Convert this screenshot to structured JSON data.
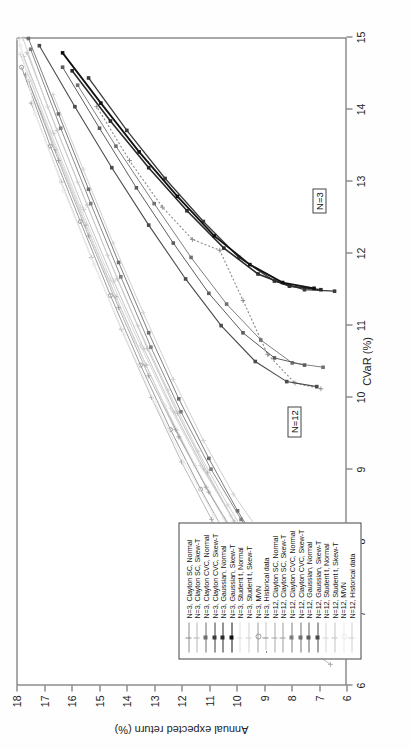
{
  "chart_data": {
    "type": "line",
    "title": "",
    "xlabel": "CVaR (%)",
    "ylabel": "Annual expected return (%)",
    "xlim": [
      6,
      15
    ],
    "ylim": [
      6,
      18
    ],
    "xticks": [
      6,
      7,
      8,
      9,
      10,
      11,
      12,
      13,
      14,
      15
    ],
    "yticks": [
      6,
      7,
      8,
      9,
      10,
      11,
      12,
      13,
      14,
      15,
      16,
      17,
      18
    ],
    "grid": false,
    "legend_position": "lower-left",
    "annotations": [
      {
        "text": "N=3",
        "x": 12.55,
        "y": 7.25
      },
      {
        "text": "N=12",
        "x": 9.45,
        "y": 8.15
      }
    ],
    "series": [
      {
        "name": "N=3, Clayton SC, Normal",
        "color": "#8c8c8c",
        "marker": "plus",
        "dash": "solid",
        "width": 0.8,
        "x": [
          6.62,
          6.95,
          7.45,
          8.05,
          8.75,
          9.55,
          10.45,
          11.4,
          12.4,
          13.45,
          14.5
        ],
        "y": [
          6.95,
          7.95,
          9.0,
          10.05,
          11.1,
          12.2,
          13.3,
          14.4,
          15.5,
          16.6,
          17.7
        ]
      },
      {
        "name": "N=3, Clayton SC, Skew-T",
        "color": "#b5b5b5",
        "marker": "plus",
        "dash": "solid",
        "width": 0.8,
        "x": [
          6.72,
          7.1,
          7.6,
          8.22,
          8.95,
          9.78,
          10.68,
          11.65,
          12.68,
          13.72,
          14.8
        ],
        "y": [
          6.9,
          7.9,
          8.95,
          10.0,
          11.05,
          12.15,
          13.25,
          14.35,
          15.45,
          16.55,
          17.65
        ]
      },
      {
        "name": "N=3, Clayton CVC, Normal",
        "color": "#6e6e6e",
        "marker": "square",
        "dash": "solid",
        "width": 0.9,
        "x": [
          6.88,
          7.25,
          7.78,
          8.42,
          9.15,
          9.98,
          10.9,
          11.88,
          12.9,
          13.95,
          15.0
        ],
        "y": [
          6.85,
          7.85,
          8.9,
          9.95,
          11.0,
          12.1,
          13.2,
          14.3,
          15.4,
          16.5,
          17.6
        ]
      },
      {
        "name": "N=3, Clayton CVC, Skew-T",
        "color": "#3a3a3a",
        "marker": "square",
        "dash": "solid",
        "width": 1.3,
        "x": [
          11.48,
          11.5,
          11.62,
          11.95,
          12.45,
          13.05,
          13.72,
          14.45
        ],
        "y": [
          6.4,
          7.5,
          8.6,
          9.9,
          11.2,
          12.6,
          14.0,
          15.4
        ]
      },
      {
        "name": "N=3, Gaussian, Normal",
        "color": "#2a2a2a",
        "marker": "square",
        "dash": "solid",
        "width": 1.6,
        "x": [
          11.5,
          11.55,
          11.72,
          12.08,
          12.6,
          13.2,
          13.85,
          14.55
        ],
        "y": [
          6.9,
          8.05,
          9.2,
          10.45,
          11.8,
          13.2,
          14.6,
          16.0
        ]
      },
      {
        "name": "N=3, Gaussian, Skew-T",
        "color": "#111111",
        "marker": "square",
        "dash": "solid",
        "width": 1.8,
        "x": [
          11.52,
          11.6,
          11.85,
          12.25,
          12.8,
          13.42,
          14.1,
          14.8
        ],
        "y": [
          7.15,
          8.3,
          9.5,
          10.8,
          12.15,
          13.55,
          14.95,
          16.35
        ]
      },
      {
        "name": "N=3, Student t, Normal",
        "color": "#e0e0e0",
        "marker": "plus",
        "dash": "solid",
        "width": 1.0,
        "x": [
          6.78,
          7.15,
          7.68,
          8.32,
          9.05,
          9.88,
          10.78,
          11.75,
          12.78,
          13.85,
          14.9
        ],
        "y": [
          7.35,
          8.35,
          9.4,
          10.45,
          11.5,
          12.6,
          13.7,
          14.8,
          15.9,
          17.0,
          17.9
        ]
      },
      {
        "name": "N=3, Student t, Skew-T",
        "color": "#cfcfcf",
        "marker": "plus",
        "dash": "solid",
        "width": 1.0,
        "x": [
          6.9,
          7.3,
          7.85,
          8.5,
          9.25,
          10.1,
          11.0,
          11.98,
          13.0,
          14.05,
          15.0
        ],
        "y": [
          7.2,
          8.2,
          9.25,
          10.3,
          11.4,
          12.5,
          13.6,
          14.7,
          15.8,
          16.9,
          17.8
        ]
      },
      {
        "name": "N=3, MVN",
        "color": "#9a9a9a",
        "marker": "circle",
        "dash": "solid",
        "width": 1.0,
        "x": [
          6.92,
          7.38,
          8.0,
          8.72,
          9.55,
          10.45,
          11.42,
          12.45,
          13.5,
          14.6
        ],
        "y": [
          8.2,
          9.2,
          10.25,
          11.3,
          12.4,
          13.5,
          14.6,
          15.7,
          16.8,
          17.85
        ]
      },
      {
        "name": "N=3, Historical data",
        "color": "#8a8a8a",
        "marker": "plus",
        "dash": "dotted",
        "width": 1.1,
        "x": [
          10.12,
          10.2,
          10.6,
          11.35,
          12.05,
          12.2,
          12.65,
          13.3,
          14.05
        ],
        "y": [
          6.9,
          7.85,
          8.85,
          9.75,
          10.6,
          11.6,
          12.7,
          13.9,
          15.1
        ]
      },
      {
        "name": "N=12, Clayton SC, Normal",
        "color": "#a8a8a8",
        "marker": "plus",
        "dash": "solid",
        "width": 0.8,
        "x": [
          6.28,
          6.55,
          7.0,
          7.6,
          8.3,
          9.1,
          10.0,
          10.95,
          11.95,
          13.0,
          14.1
        ],
        "y": [
          6.55,
          7.6,
          8.7,
          9.8,
          10.9,
          12.0,
          13.1,
          14.2,
          15.3,
          16.4,
          17.5
        ]
      },
      {
        "name": "N=12, Clayton SC, Skew-T",
        "color": "#9d9d9d",
        "marker": "plus",
        "dash": "solid",
        "width": 0.8,
        "x": [
          6.85,
          7.05,
          7.45,
          8.0,
          8.68,
          9.45,
          10.3,
          11.25,
          12.25,
          13.3,
          14.4
        ],
        "y": [
          6.72,
          7.75,
          8.8,
          9.9,
          11.0,
          12.1,
          13.2,
          14.3,
          15.4,
          16.5,
          17.6
        ]
      },
      {
        "name": "N=12, Clayton CVC, Normal",
        "color": "#7e7e7e",
        "marker": "square",
        "dash": "solid",
        "width": 0.9,
        "x": [
          7.02,
          7.28,
          7.72,
          8.3,
          9.0,
          9.8,
          10.7,
          11.68,
          12.7,
          13.75,
          14.85
        ],
        "y": [
          6.62,
          7.65,
          8.72,
          9.82,
          10.92,
          12.02,
          13.12,
          14.22,
          15.32,
          16.42,
          17.52
        ]
      },
      {
        "name": "N=12, Clayton CVC, Skew-T",
        "color": "#707070",
        "marker": "square",
        "dash": "solid",
        "width": 0.9,
        "x": [
          10.42,
          10.48,
          10.8,
          11.3,
          11.95,
          12.7,
          13.5,
          14.35
        ],
        "y": [
          6.82,
          7.95,
          9.1,
          10.35,
          11.65,
          13.0,
          14.4,
          15.8
        ]
      },
      {
        "name": "N=12, Gaussian, Normal",
        "color": "#5c5c5c",
        "marker": "square",
        "dash": "solid",
        "width": 1.0,
        "x": [
          10.45,
          10.55,
          10.9,
          11.45,
          12.15,
          12.92,
          13.75,
          14.6
        ],
        "y": [
          7.5,
          8.6,
          9.75,
          11.0,
          12.3,
          13.65,
          15.0,
          16.35
        ]
      },
      {
        "name": "N=12, Gaussian, Skew-T",
        "color": "#4a4a4a",
        "marker": "square",
        "dash": "solid",
        "width": 1.1,
        "x": [
          10.15,
          10.22,
          10.5,
          11.0,
          11.65,
          12.4,
          13.2,
          14.05,
          14.9
        ],
        "y": [
          7.05,
          8.15,
          9.3,
          10.55,
          11.85,
          13.2,
          14.55,
          15.9,
          17.2
        ]
      },
      {
        "name": "N=12, Student t, Normal",
        "color": "#d8d8d8",
        "marker": "plus",
        "dash": "solid",
        "width": 1.0,
        "x": [
          6.98,
          7.28,
          7.75,
          8.35,
          9.05,
          9.85,
          10.72,
          11.65,
          12.65,
          13.7,
          14.78
        ],
        "y": [
          7.0,
          8.05,
          9.1,
          10.2,
          11.3,
          12.4,
          13.5,
          14.6,
          15.7,
          16.8,
          17.9
        ]
      },
      {
        "name": "N=12, Student t, Skew-T",
        "color": "#c4c4c4",
        "marker": "plus",
        "dash": "solid",
        "width": 1.0,
        "x": [
          6.9,
          7.2,
          7.68,
          8.28,
          9.0,
          9.8,
          10.68,
          11.62,
          12.62,
          13.68,
          14.75
        ],
        "y": [
          6.85,
          7.9,
          8.98,
          10.08,
          11.18,
          12.28,
          13.38,
          14.48,
          15.58,
          16.68,
          17.78
        ]
      },
      {
        "name": "N=12, MVN",
        "color": "#ececec",
        "marker": "circle",
        "dash": "solid",
        "width": 1.2,
        "x": [
          6.85,
          7.18,
          7.7,
          8.35,
          9.1,
          9.95,
          10.88,
          11.85,
          12.88,
          13.95,
          15.0
        ],
        "y": [
          7.6,
          8.65,
          9.7,
          10.8,
          11.9,
          13.0,
          14.1,
          15.2,
          16.3,
          17.35,
          17.95
        ]
      },
      {
        "name": "N=12, Historical data",
        "color": "#d0d0d0",
        "marker": "plus",
        "dash": "solid",
        "width": 1.0,
        "x": [
          7.62,
          7.7,
          8.05,
          8.65,
          9.4,
          10.25,
          11.18,
          12.15,
          13.18,
          14.22
        ],
        "y": [
          6.82,
          7.9,
          9.0,
          10.1,
          11.2,
          12.3,
          13.4,
          14.5,
          15.6,
          16.7
        ]
      }
    ]
  },
  "axis": {
    "x_title": "CVaR (%)",
    "y_title": "Annual expected return (%)",
    "x_tick_labels": [
      "6",
      "7",
      "8",
      "9",
      "10",
      "11",
      "12",
      "13",
      "14",
      "15"
    ],
    "y_tick_labels": [
      "6",
      "7",
      "8",
      "9",
      "10",
      "11",
      "12",
      "13",
      "14",
      "15",
      "16",
      "17",
      "18"
    ]
  },
  "annotations": {
    "n3": "N=3",
    "n12": "N=12"
  },
  "legend": {
    "entries": [
      "N=3, Clayton SC, Normal",
      "N=3, Clayton SC, Skew-T",
      "N=3, Clayton CVC, Normal",
      "N=3, Clayton CVC, Skew-T",
      "N=3, Gaussian, Normal",
      "N=3, Gaussian, Skew-T",
      "N=3, Student t, Normal",
      "N=3, Student t, Skew-T",
      "N=3, MVN",
      "N=3, Historical data",
      "N=12, Clayton SC, Normal",
      "N=12, Clayton SC, Skew-T",
      "N=12, Clayton CVC, Normal",
      "N=12, Clayton CVC, Skew-T",
      "N=12, Gaussian, Normal",
      "N=12, Gaussian, Skew-T",
      "N=12, Student t, Normal",
      "N=12, Student t, Skew-T",
      "N=12, MVN",
      "N=12, Historical data"
    ]
  }
}
